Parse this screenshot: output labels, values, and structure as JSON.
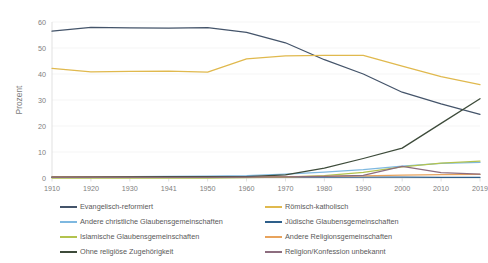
{
  "chart_data": {
    "type": "line",
    "title": "",
    "xlabel": "",
    "ylabel": "Prozent",
    "x": [
      "1910",
      "1920",
      "1930",
      "1941",
      "1950",
      "1960",
      "1970",
      "1980",
      "1990",
      "2000",
      "2010",
      "2019"
    ],
    "categories": [
      "1910",
      "1920",
      "1930",
      "1941",
      "1950",
      "1960",
      "1970",
      "1980",
      "1990",
      "2000",
      "2010",
      "2019"
    ],
    "ylim": [
      0,
      60
    ],
    "yticks": [
      0,
      10,
      20,
      30,
      40,
      50,
      60
    ],
    "xlim_labels": [
      "1910",
      "2019"
    ],
    "grid": true,
    "legend_position": "bottom",
    "series": [
      {
        "name": "Evangelisch-reformiert",
        "color": "#44546a",
        "values": [
          56.5,
          57.9,
          57.7,
          57.6,
          57.8,
          56.0,
          52.0,
          45.5,
          40.0,
          33.0,
          28.5,
          24.5
        ]
      },
      {
        "name": "Römisch-katholisch",
        "color": "#e0b94e",
        "values": [
          42.2,
          40.8,
          41.0,
          41.1,
          40.7,
          45.8,
          47.0,
          47.2,
          47.2,
          43.0,
          39.0,
          35.9
        ]
      },
      {
        "name": "Andere christliche Glaubensgemeinschaften",
        "color": "#7eb8e0",
        "values": [
          0.3,
          0.4,
          0.5,
          0.6,
          0.7,
          0.9,
          1.5,
          2.3,
          3.2,
          4.6,
          5.6,
          6.0
        ]
      },
      {
        "name": "Jüdische Glaubensgemeinschaften",
        "color": "#2e5f8a",
        "values": [
          0.5,
          0.4,
          0.4,
          0.4,
          0.4,
          0.4,
          0.3,
          0.3,
          0.3,
          0.3,
          0.2,
          0.2
        ]
      },
      {
        "name": "Islamische Glaubensgemeinschaften",
        "color": "#b3c34e",
        "values": [
          0.0,
          0.0,
          0.0,
          0.0,
          0.0,
          0.1,
          0.3,
          0.9,
          2.2,
          4.3,
          5.7,
          6.5
        ]
      },
      {
        "name": "Andere Religionsgemeinschaften",
        "color": "#e8a35c",
        "values": [
          0.4,
          0.4,
          0.4,
          0.4,
          0.4,
          0.4,
          0.5,
          0.6,
          0.8,
          1.1,
          1.3,
          1.4
        ]
      },
      {
        "name": "Ohne religiöse Zugehörigkeit",
        "color": "#3d4b3a",
        "values": [
          0.2,
          0.3,
          0.4,
          0.5,
          0.5,
          0.5,
          1.2,
          3.8,
          7.5,
          11.5,
          21.0,
          30.5
        ]
      },
      {
        "name": "Religion/Konfession unbekannt",
        "color": "#8d6d7f",
        "values": [
          0.2,
          0.2,
          0.2,
          0.2,
          0.2,
          0.3,
          0.4,
          0.6,
          1.0,
          4.5,
          2.1,
          1.5
        ]
      }
    ]
  },
  "legend": {
    "left_items": [
      "Evangelisch-reformiert",
      "Andere christliche Glaubensgemeinschaften",
      "Islamische Glaubensgemeinschaften",
      "Ohne religiöse Zugehörigkeit"
    ],
    "right_items": [
      "Römisch-katholisch",
      "Jüdische Glaubensgemeinschaften",
      "Andere Religionsgemeinschaften",
      "Religion/Konfession unbekannt"
    ],
    "left_colors": [
      "#44546a",
      "#7eb8e0",
      "#b3c34e",
      "#3d4b3a"
    ],
    "right_colors": [
      "#e0b94e",
      "#2e5f8a",
      "#e8a35c",
      "#8d6d7f"
    ]
  }
}
